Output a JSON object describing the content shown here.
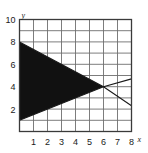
{
  "caption": {
    "left_fragment": "",
    "top_fragment": ""
  },
  "chart_data": {
    "type": "area",
    "title": "",
    "xlabel": "x",
    "ylabel": "y",
    "xlim": [
      0,
      8
    ],
    "ylim": [
      0,
      10
    ],
    "grid": true,
    "legend": "none",
    "x_ticks": [
      1,
      2,
      3,
      4,
      5,
      6,
      7,
      8
    ],
    "y_ticks": [
      2,
      4,
      6,
      8,
      10
    ],
    "x_tick_labels": [
      "1",
      "2",
      "3",
      "4",
      "5",
      "6",
      "7",
      "8"
    ],
    "y_tick_labels": [
      "2",
      "4",
      "6",
      "8",
      "10"
    ],
    "shaded_region": {
      "name": "filled-triangle",
      "fill": "#111111",
      "vertices": [
        [
          0,
          8
        ],
        [
          0,
          1
        ],
        [
          6,
          4
        ]
      ]
    },
    "series": [
      {
        "name": "upper-boundary-line",
        "type": "line",
        "color": "#1a1a1a",
        "x": [
          0,
          6,
          8
        ],
        "y": [
          8,
          4,
          2.3
        ]
      },
      {
        "name": "lower-boundary-line",
        "type": "line",
        "color": "#1a1a1a",
        "x": [
          0,
          6,
          8
        ],
        "y": [
          1,
          4,
          4.7
        ]
      }
    ],
    "intersection_point": [
      6,
      4
    ],
    "axis_colors": {
      "grid": "#6e6e6e",
      "frame": "#3a3a3a",
      "fill": "#111111"
    }
  }
}
